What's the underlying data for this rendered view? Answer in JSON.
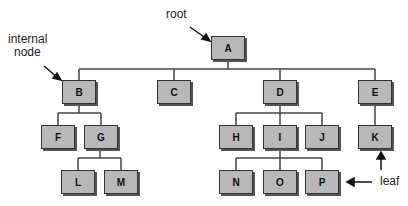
{
  "labels": {
    "root": "root",
    "internal_node": "internal\nnode",
    "internal_line1": "internal",
    "internal_line2": "node",
    "leaf": "leaf"
  },
  "nodes": {
    "A": "A",
    "B": "B",
    "C": "C",
    "D": "D",
    "E": "E",
    "F": "F",
    "G": "G",
    "H": "H",
    "I": "I",
    "J": "J",
    "K": "K",
    "L": "L",
    "M": "M",
    "N": "N",
    "O": "O",
    "P": "P"
  },
  "edges": [
    [
      "A",
      "B"
    ],
    [
      "A",
      "C"
    ],
    [
      "A",
      "D"
    ],
    [
      "A",
      "E"
    ],
    [
      "B",
      "F"
    ],
    [
      "B",
      "G"
    ],
    [
      "G",
      "L"
    ],
    [
      "G",
      "M"
    ],
    [
      "D",
      "H"
    ],
    [
      "D",
      "I"
    ],
    [
      "D",
      "J"
    ],
    [
      "I",
      "N"
    ],
    [
      "I",
      "O"
    ],
    [
      "I",
      "P"
    ],
    [
      "E",
      "K"
    ]
  ],
  "colors": {
    "node_fill": "#b8b8b8",
    "line": "#444444"
  }
}
